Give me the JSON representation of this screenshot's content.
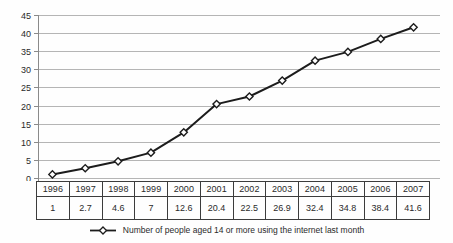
{
  "chart_data": {
    "type": "line",
    "categories": [
      "1996",
      "1997",
      "1998",
      "1999",
      "2000",
      "2001",
      "2002",
      "2003",
      "2004",
      "2005",
      "2006",
      "2007"
    ],
    "series": [
      {
        "name": "Number of people aged 14 or more using the internet last month",
        "values": [
          1,
          2.7,
          4.6,
          7,
          12.6,
          20.4,
          22.5,
          26.9,
          32.4,
          34.8,
          38.4,
          41.6
        ]
      }
    ],
    "title": "",
    "xlabel": "",
    "ylabel": "",
    "ylim": [
      0,
      45
    ],
    "yticks": [
      0,
      5,
      10,
      15,
      20,
      25,
      30,
      35,
      40,
      45
    ],
    "grid": true,
    "legend_position": "bottom",
    "marker": "open-diamond"
  },
  "table": {
    "year_row": [
      "1996",
      "1997",
      "1998",
      "1999",
      "2000",
      "2001",
      "2002",
      "2003",
      "2004",
      "2005",
      "2006",
      "2007"
    ],
    "value_row": [
      "1",
      "2.7",
      "4.6",
      "7",
      "12.6",
      "20.4",
      "22.5",
      "26.9",
      "32.4",
      "34.8",
      "38.4",
      "41.6"
    ]
  },
  "colors": {
    "gridline": "#b5b5b5",
    "axis": "#8a8a8a",
    "line": "#1c1c1c",
    "marker_fill": "#ffffff",
    "table_border": "#3c3c3c",
    "text": "#2a2a2a"
  }
}
